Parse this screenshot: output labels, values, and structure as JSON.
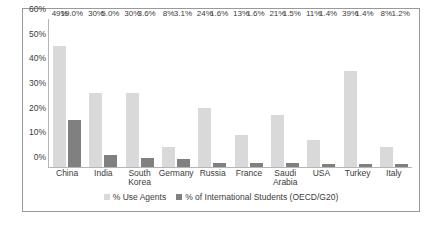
{
  "chart_data": {
    "type": "bar",
    "title": "",
    "xlabel": "",
    "ylabel": "",
    "ylim": [
      0,
      60
    ],
    "ytick_labels": [
      "60%",
      "50%",
      "40%",
      "30%",
      "20%",
      "10%",
      "0%"
    ],
    "ytick_values": [
      60,
      50,
      40,
      30,
      20,
      10,
      0
    ],
    "grid": false,
    "legend_position": "bottom-center",
    "categories": [
      "China",
      "India",
      "South Korea",
      "Germany",
      "Russia",
      "France",
      "Saudi Arabia",
      "USA",
      "Turkey",
      "Italy"
    ],
    "series": [
      {
        "name": "% Use Agents",
        "color": "#d9d9d9",
        "values": [
          49,
          30,
          30,
          8,
          24,
          13,
          21,
          11,
          39,
          8
        ],
        "data_labels": [
          "49%",
          "30%",
          "30%",
          "8%",
          "24%",
          "13%",
          "21%",
          "11%",
          "39%",
          "8%"
        ]
      },
      {
        "name": "% of International Students (OECD/G20)",
        "color": "#808080",
        "values": [
          19.0,
          5.0,
          3.6,
          3.1,
          1.6,
          1.6,
          1.5,
          1.4,
          1.4,
          1.2
        ],
        "data_labels": [
          "19.0%",
          "5.0%",
          "3.6%",
          "3.1%",
          "1.6%",
          "1.6%",
          "1.5%",
          "1.4%",
          "1.4%",
          "1.2%"
        ]
      }
    ]
  }
}
